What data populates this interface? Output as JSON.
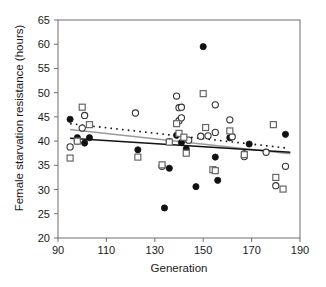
{
  "chart_data": {
    "type": "scatter",
    "title": "",
    "xlabel": "Generation",
    "ylabel": "Female starvation resistance (hours)",
    "xlim": [
      90,
      190
    ],
    "ylim": [
      20,
      65
    ],
    "xticks": [
      90,
      110,
      130,
      150,
      170,
      190
    ],
    "yticks": [
      20,
      25,
      30,
      35,
      40,
      45,
      50,
      55,
      60,
      65
    ],
    "grid": false,
    "legend": "none",
    "series": [
      {
        "name": "filled-circle",
        "marker": "filled-circle",
        "color": "#111111",
        "points": [
          [
            95,
            44.5
          ],
          [
            98,
            40.7
          ],
          [
            101,
            39.6
          ],
          [
            103,
            40.7
          ],
          [
            123,
            38.2
          ],
          [
            136,
            34.4
          ],
          [
            139,
            41.2
          ],
          [
            141,
            39.7
          ],
          [
            143,
            38.4
          ],
          [
            134,
            26.2
          ],
          [
            147,
            30.6
          ],
          [
            150,
            59.5
          ],
          [
            155,
            36.7
          ],
          [
            156,
            31.9
          ],
          [
            161,
            40.7
          ],
          [
            167,
            37.4
          ],
          [
            169,
            39.4
          ],
          [
            184,
            41.4
          ]
        ]
      },
      {
        "name": "open-circle",
        "marker": "open-circle",
        "color": "#111111",
        "points": [
          [
            95,
            38.8
          ],
          [
            100,
            42.7
          ],
          [
            101,
            45.3
          ],
          [
            98,
            40.0
          ],
          [
            122,
            45.8
          ],
          [
            133,
            34.8
          ],
          [
            136,
            39.9
          ],
          [
            139,
            49.3
          ],
          [
            140,
            46.9
          ],
          [
            141,
            47.0
          ],
          [
            140,
            44.2
          ],
          [
            141,
            44.8
          ],
          [
            144,
            40.2
          ],
          [
            149,
            41.0
          ],
          [
            152,
            41.1
          ],
          [
            155,
            47.5
          ],
          [
            155,
            41.8
          ],
          [
            161,
            44.4
          ],
          [
            162,
            40.9
          ],
          [
            167,
            36.8
          ],
          [
            176,
            37.7
          ],
          [
            180,
            30.8
          ],
          [
            184,
            34.8
          ]
        ]
      },
      {
        "name": "open-square",
        "marker": "open-square",
        "color": "#555555",
        "points": [
          [
            95,
            36.5
          ],
          [
            98,
            40.0
          ],
          [
            100,
            47.0
          ],
          [
            103,
            43.4
          ],
          [
            123,
            36.7
          ],
          [
            133,
            35.1
          ],
          [
            136,
            39.8
          ],
          [
            139,
            43.6
          ],
          [
            140,
            41.6
          ],
          [
            142,
            40.8
          ],
          [
            143,
            37.5
          ],
          [
            150,
            49.8
          ],
          [
            151,
            42.8
          ],
          [
            154,
            34.1
          ],
          [
            155,
            33.9
          ],
          [
            161,
            42.1
          ],
          [
            167,
            37.2
          ],
          [
            179,
            43.4
          ],
          [
            180,
            32.5
          ],
          [
            183,
            30.1
          ]
        ]
      }
    ],
    "trendlines": [
      {
        "name": "dashed-trend",
        "style": "dashed",
        "color": "#111111",
        "x": [
          95,
          184
        ],
        "y": [
          43.6,
          38.6
        ]
      },
      {
        "name": "gray-trend",
        "style": "solid",
        "color": "#9a9a9a",
        "x": [
          95,
          186
        ],
        "y": [
          42.4,
          37.4
        ]
      },
      {
        "name": "black-trend",
        "style": "solid",
        "color": "#111111",
        "x": [
          95,
          186
        ],
        "y": [
          40.6,
          37.7
        ]
      }
    ]
  },
  "axis": {
    "x_label": "Generation",
    "y_label": "Female starvation resistance (hours)",
    "x_tick_labels": [
      "90",
      "110",
      "130",
      "150",
      "170",
      "190"
    ],
    "y_tick_labels": [
      "20",
      "25",
      "30",
      "35",
      "40",
      "45",
      "50",
      "55",
      "60",
      "65"
    ]
  }
}
